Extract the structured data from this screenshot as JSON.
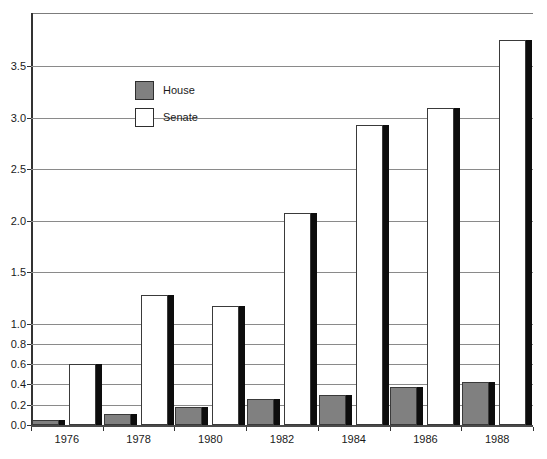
{
  "chart_data": {
    "type": "bar",
    "title": "",
    "xlabel": "",
    "ylabel": "",
    "categories": [
      "1976",
      "1978",
      "1980",
      "1982",
      "1984",
      "1986",
      "1988"
    ],
    "series": [
      {
        "name": "House",
        "color": "#808080",
        "values": [
          0.05,
          0.11,
          0.18,
          0.26,
          0.3,
          0.37,
          0.42
        ]
      },
      {
        "name": "Senate",
        "color": "#ffffff",
        "values": [
          0.6,
          1.28,
          1.17,
          2.07,
          2.93,
          3.09,
          3.75
        ]
      }
    ],
    "ylim": [
      0,
      3.9
    ],
    "grid": true,
    "legend_position": "upper-left",
    "axis_note": "broken y-axis: 0.2 steps below 1.0, 0.5 steps above",
    "yticks": [
      {
        "label": "0.0",
        "value": 0
      },
      {
        "label": "0.2",
        "value": 0.2
      },
      {
        "label": "0.4",
        "value": 0.4
      },
      {
        "label": "0.6",
        "value": 0.6
      },
      {
        "label": "0.8",
        "value": 0.8
      },
      {
        "label": "1.0",
        "value": 1.0
      },
      {
        "label": "1.5",
        "value": 1.5
      },
      {
        "label": "2.0",
        "value": 2.0
      },
      {
        "label": "2.5",
        "value": 2.5
      },
      {
        "label": "3.0",
        "value": 3.0
      },
      {
        "label": "3.5",
        "value": 3.5
      }
    ]
  },
  "legend": {
    "items": [
      {
        "label": "House"
      },
      {
        "label": "Senate"
      }
    ]
  }
}
